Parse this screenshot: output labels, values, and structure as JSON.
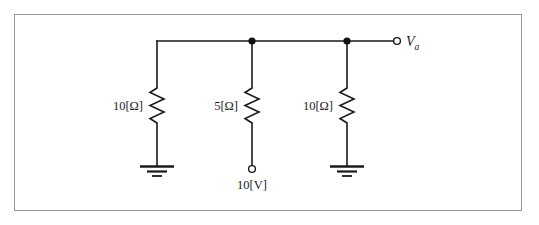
{
  "figure": {
    "type": "electrical-circuit-schematic",
    "title": "",
    "frame": {
      "border_color": "#9a9a9a",
      "background": "#ffffff"
    },
    "line_color": "#1a1a1a"
  },
  "circuit": {
    "top_rail_label": "",
    "branches": [
      {
        "id": "branch-left",
        "component": "resistor",
        "label": "10[Ω]",
        "termination": "ground",
        "termination_label": "",
        "x": 157
      },
      {
        "id": "branch-middle",
        "component": "resistor",
        "label": "5[Ω]",
        "termination": "open-terminal",
        "termination_label": "10[V]",
        "x": 252
      },
      {
        "id": "branch-right",
        "component": "resistor",
        "label": "10[Ω]",
        "termination": "ground",
        "termination_label": "",
        "x": 347
      }
    ],
    "output_terminal": {
      "id": "terminal-va",
      "label_base": "V",
      "label_subscript": "a",
      "x": 397,
      "y": 41
    },
    "junction_nodes": [
      {
        "id": "node-middle",
        "x": 252,
        "y": 41
      },
      {
        "id": "node-right",
        "x": 347,
        "y": 41
      }
    ]
  }
}
